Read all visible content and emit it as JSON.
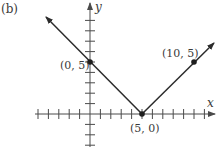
{
  "panel_label": "(b)",
  "chart_data": {
    "type": "line",
    "title": "",
    "panel": "(b)",
    "xlabel": "x",
    "ylabel": "y",
    "equation_hint": "V-shaped absolute value graph with vertex at (5, 0)",
    "xlim": [
      -5,
      12
    ],
    "ylim": [
      -3,
      10
    ],
    "grid": false,
    "x_ticks": [
      -5,
      -4,
      -3,
      -2,
      -1,
      1,
      2,
      3,
      4,
      5,
      6,
      7,
      8,
      9,
      10,
      11
    ],
    "y_ticks": [
      -3,
      -2,
      -1,
      1,
      2,
      3,
      4,
      5,
      6,
      7,
      8,
      9
    ],
    "series": [
      {
        "name": "V graph",
        "x": [
          -4.2,
          0,
          5,
          10,
          12
        ],
        "y": [
          9.2,
          5,
          0,
          5,
          6.8
        ],
        "arrows": "both ends"
      }
    ],
    "labeled_points": [
      {
        "label": "(0, 5)",
        "x": 0,
        "y": 5
      },
      {
        "label": "(5, 0)",
        "x": 5,
        "y": 0
      },
      {
        "label": "(10, 5)",
        "x": 10,
        "y": 5
      }
    ]
  },
  "colors": {
    "line": "#2b2b2b",
    "axis": "#4a4a4a",
    "text": "#3a3a3a"
  }
}
